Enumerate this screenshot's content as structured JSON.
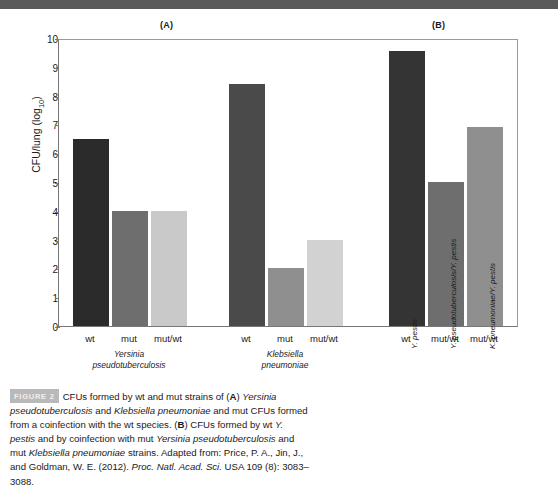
{
  "panels": {
    "a_letter": "(A)",
    "b_letter": "(B)"
  },
  "axis": {
    "y_title_main": "CFU/lung (log",
    "y_title_sub": "10",
    "y_title_close": ")",
    "y_ticks": [
      "10",
      "9",
      "8",
      "7",
      "6",
      "5",
      "4",
      "3",
      "2",
      "1",
      "0"
    ],
    "y_min": 0,
    "y_max": 10
  },
  "groups": [
    {
      "name_line1": "Yersinia",
      "name_line2": "pseudotuberculosis",
      "ticks": [
        "wt",
        "mut",
        "mut/wt"
      ]
    },
    {
      "name_line1": "Klebsiella",
      "name_line2": "pneumoniae",
      "ticks": [
        "wt",
        "mut",
        "mut/wt"
      ]
    },
    {
      "name_line1": "",
      "name_line2": "",
      "ticks": [
        "wt",
        "mut/wt",
        "mut/wt"
      ],
      "rotated": [
        "Y. pestis",
        "Y. pseudotuberculosis/Y. pestis",
        "K. pneumoniae/Y. pestis"
      ]
    }
  ],
  "colors": {
    "bar_dark": "#2b2b2b",
    "bar_medium": "#6e6e6e",
    "bar_light": "#c9c9c9",
    "bar_mid_light": "#8f8f8f",
    "axis": "#777777",
    "banner": "#5a5a5a",
    "badge": "#b9b9b9"
  },
  "chart_data": {
    "type": "bar",
    "title": "",
    "xlabel": "",
    "ylabel": "CFU/lung (log10)",
    "ylim": [
      0,
      10
    ],
    "grid": false,
    "legend": "none",
    "categories": [
      "Y. pseudotuberculosis wt",
      "Y. pseudotuberculosis mut",
      "Y. pseudotuberculosis mut/wt",
      "K. pneumoniae wt",
      "K. pneumoniae mut",
      "K. pneumoniae mut/wt",
      "Y. pestis wt",
      "Y. pseudotuberculosis/Y. pestis mut/wt",
      "K. pneumoniae/Y. pestis mut/wt"
    ],
    "values": [
      6.5,
      4.0,
      4.0,
      8.4,
      2.0,
      3.0,
      9.55,
      5.0,
      6.9
    ],
    "bar_colors": [
      "#2b2b2b",
      "#6e6e6e",
      "#c9c9c9",
      "#4a4a4a",
      "#8f8f8f",
      "#d2d2d2",
      "#343434",
      "#6e6e6e",
      "#8f8f8f"
    ]
  },
  "caption": {
    "badge": "FIGURE 2",
    "seg1": "CFUs formed by wt and mut strains of (",
    "bold_a": "A",
    "seg2": ") ",
    "ital1": "Yersinia pseudotuberculosis",
    "seg3": " and ",
    "ital2": "Klebsiella pneumoniae",
    "seg4": " and mut CFUs formed from a coinfection with the wt species. (",
    "bold_b": "B",
    "seg5": ") CFUs formed by wt ",
    "ital3": "Y. pestis",
    "seg6": " and by coinfection with mut ",
    "ital4": "Yersinia pseudotuberculosis",
    "seg7": " and mut ",
    "ital5": "Klebsiella pneumoniae",
    "seg8": " strains. Adapted from: Price, P. A., Jin, J., and Goldman, W. E. (2012). ",
    "ital6": "Proc. Natl. Acad. Sci.",
    "seg9": " USA 109 (8): 3083–3088."
  }
}
